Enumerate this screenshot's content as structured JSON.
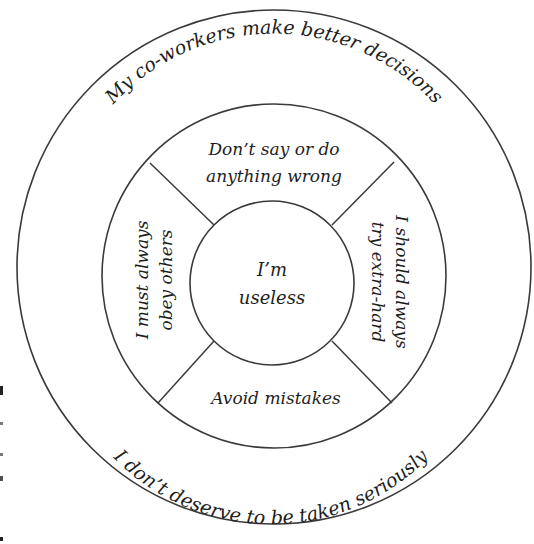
{
  "diagram": {
    "type": "concentric-circles",
    "center_core": {
      "line1": "I’m",
      "line2": "useless"
    },
    "middle_ring": {
      "top": {
        "line1": "Don’t say or do",
        "line2": "anything wrong"
      },
      "right": {
        "line1": "I should always",
        "line2": "try extra-hard"
      },
      "bottom": {
        "line1": "Avoid mistakes"
      },
      "left": {
        "line1": "I must always",
        "line2": "obey others"
      }
    },
    "outer_ring": {
      "top_arc": "My co-workers make better decisions",
      "bottom_arc": "I don’t deserve to be taken seriously"
    },
    "colors": {
      "line": "#3a3a3a",
      "text": "#1e1e1e",
      "background": "#ffffff"
    }
  }
}
